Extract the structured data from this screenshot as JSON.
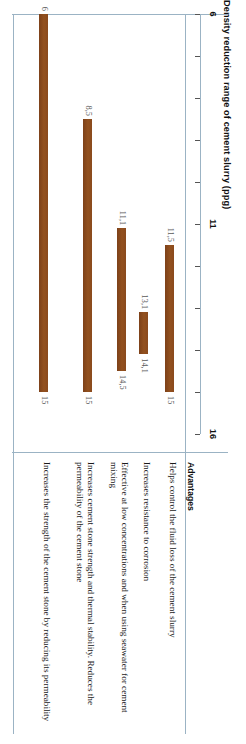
{
  "figure": {
    "title": "Density reduction range of cement slurry (ppg)",
    "col_header_left": "Extender",
    "col_header_right": "Advantages"
  },
  "chart_data": {
    "type": "bar",
    "orientation": "horizontal-range",
    "title": "Density reduction range of cement slurry (ppg)",
    "xlabel": "Density reduction range of cement slurry (ppg)",
    "ylabel": "Extender",
    "xlim": [
      6,
      16
    ],
    "xticks": [
      6,
      7,
      8,
      9,
      10,
      11,
      12,
      13,
      14,
      15,
      16
    ],
    "xticklabels_shown": [
      "6",
      "11",
      "16"
    ],
    "grid": false,
    "legend": "none",
    "bar_color": "#8a4a1d",
    "categories": [
      "Bentonite",
      "Fly ash",
      "Sodium silicate",
      "Microspheres",
      "Foam cement"
    ],
    "ranges": [
      {
        "category": "Bentonite",
        "low": 11.5,
        "high": 15,
        "low_label": "11,5",
        "high_label": "15"
      },
      {
        "category": "Fly ash",
        "low": 13.1,
        "high": 14.1,
        "low_label": "13,1",
        "high_label": "14,1"
      },
      {
        "category": "Sodium silicate",
        "low": 11.1,
        "high": 14.5,
        "low_label": "11,1",
        "high_label": "14,5"
      },
      {
        "category": "Microspheres",
        "low": 8.5,
        "high": 15,
        "low_label": "8,5",
        "high_label": "15"
      },
      {
        "category": "Foam cement",
        "low": 6,
        "high": 15,
        "low_label": "6",
        "high_label": "15"
      }
    ]
  },
  "rows": [
    {
      "extender": "Bentonite",
      "advantage": "Helps control the fluid loss of the cement slurry"
    },
    {
      "extender": "Fly ash",
      "advantage": "Increases resistance to corrosion"
    },
    {
      "extender": "Sodium silicate",
      "advantage": "Effective at low concentrations and when using seawater for cement mixing"
    },
    {
      "extender": "Microspheres",
      "advantage": "Increases cement stone strength and thermal stability. Reduces the permeability of the cement stone"
    },
    {
      "extender": "Foam cement",
      "advantage": "Increases the strength of the cement stone by reducing its permeability"
    }
  ]
}
